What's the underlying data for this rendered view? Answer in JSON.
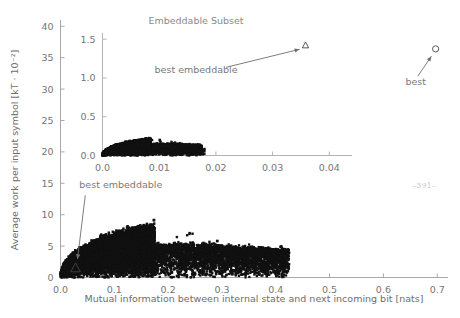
{
  "figure": {
    "page_number": "–391–",
    "background_color": "#ffffff",
    "point_color": "#111111",
    "axis_color": "#a8a8a8",
    "text_color": "#757575"
  },
  "chart_data": [
    {
      "type": "scatter",
      "id": "main",
      "title": "",
      "xlabel": "Mutual information between internal state and next incoming bit [nats]",
      "ylabel": "Average work per input symbol [kT · 10⁻²]",
      "xlim": [
        0.0,
        0.72
      ],
      "ylim": [
        0,
        41
      ],
      "xticks": [
        0.0,
        0.1,
        0.2,
        0.3,
        0.4,
        0.5,
        0.6,
        0.7
      ],
      "xtick_labels": [
        "0.0",
        "0.1",
        "0.2",
        "0.3",
        "0.4",
        "0.5",
        "0.6",
        "0.7"
      ],
      "yticks": [
        0,
        5,
        10,
        15,
        20,
        25,
        30,
        35,
        40
      ],
      "ytick_labels": [
        "0",
        "5",
        "10",
        "15",
        "20",
        "25",
        "30",
        "35",
        "40"
      ],
      "grid": false,
      "legend": "none",
      "description": "Dense wedge-shaped cloud of black points rising from origin, peaking near x=0.17 y=9 and thinning out to x=0.42.",
      "annotations": [
        {
          "name": "best-embeddable",
          "text": "best embeddable",
          "text_x": 0.035,
          "text_y": 14.2,
          "point_x": 0.028,
          "point_y": 1.5,
          "marker": "triangle-open-white"
        },
        {
          "name": "best",
          "text": "best",
          "text_x": 0.66,
          "text_y": 30.6,
          "point_x": 0.697,
          "point_y": 36.4,
          "marker": "circle-open"
        }
      ],
      "special_points": [
        {
          "name": "best",
          "x": 0.697,
          "y": 36.4,
          "marker": "circle-open"
        },
        {
          "name": "best-embeddable",
          "x": 0.028,
          "y": 1.5,
          "marker": "triangle-white"
        }
      ]
    },
    {
      "type": "scatter",
      "id": "inset",
      "title": "Embeddable Subset",
      "xlabel": "",
      "ylabel": "",
      "xlim": [
        0.0,
        0.044
      ],
      "ylim": [
        0.0,
        1.58
      ],
      "xticks": [
        0.0,
        0.01,
        0.02,
        0.03,
        0.04
      ],
      "xtick_labels": [
        "0.0",
        "0.01",
        "0.02",
        "0.03",
        "0.04"
      ],
      "yticks": [
        0.0,
        0.5,
        1.0,
        1.5
      ],
      "ytick_labels": [
        "0.0",
        "0.5",
        "1.0",
        "1.5"
      ],
      "grid": false,
      "legend": "none",
      "description": "Dense wedge-shaped cloud of black points rising from origin, peaking near x=0.011 y=0.27 and thinning out to x=0.018.",
      "annotations": [
        {
          "name": "best-embeddable-inset",
          "text": "best embeddable",
          "text_x": 0.0165,
          "text_y": 1.06,
          "point_x": 0.0358,
          "point_y": 1.42,
          "marker": "triangle-open"
        }
      ],
      "special_points": [
        {
          "name": "best-embeddable-inset",
          "x": 0.0358,
          "y": 1.42,
          "marker": "triangle-open"
        }
      ]
    }
  ]
}
